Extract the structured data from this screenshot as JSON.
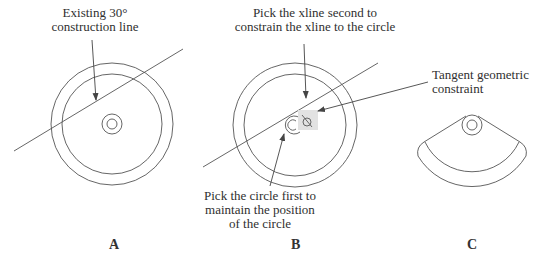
{
  "figures": {
    "a": {
      "letter": "A",
      "callout_line1": "Existing 30°",
      "callout_line2": "construction line"
    },
    "b": {
      "letter": "B",
      "callout_top_line1": "Pick the xline second to",
      "callout_top_line2": "constrain the xline to the circle",
      "callout_bottom_line1": "Pick the circle first to",
      "callout_bottom_line2": "maintain the position",
      "callout_bottom_line3": "of the circle",
      "constraint_icon": "tangent-constraint-icon"
    },
    "c": {
      "letter": "C"
    },
    "tangent_label_line1": "Tangent geometric",
    "tangent_label_line2": "constraint"
  },
  "colors": {
    "stroke": "#555555",
    "constraint_bg": "#e2e2e2"
  }
}
